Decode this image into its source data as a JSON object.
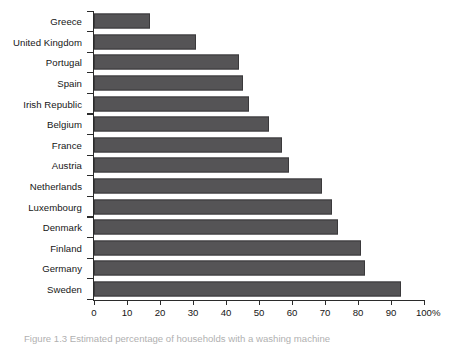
{
  "chart_data": {
    "type": "bar",
    "orientation": "horizontal",
    "title": "",
    "xlabel": "",
    "ylabel": "",
    "xlim": [
      0,
      100
    ],
    "grid": false,
    "legend": false,
    "bar_color": "#555456",
    "bar_edge_color": "#3a393b",
    "axis_color": "#2b2b2b",
    "categories": [
      "Greece",
      "United Kingdom",
      "Portugal",
      "Spain",
      "Irish Republic",
      "Belgium",
      "France",
      "Austria",
      "Netherlands",
      "Luxembourg",
      "Denmark",
      "Finland",
      "Germany",
      "Sweden"
    ],
    "values": [
      17,
      31,
      44,
      45,
      47,
      53,
      57,
      59,
      69,
      72,
      74,
      81,
      82,
      93
    ],
    "xticks": [
      0,
      10,
      20,
      30,
      40,
      50,
      60,
      70,
      80,
      90,
      100
    ],
    "xtick_labels": [
      "0",
      "10",
      "20",
      "30",
      "40",
      "50",
      "60",
      "70",
      "80",
      "90",
      "100%"
    ]
  },
  "caption": {
    "text": "Figure  1.3   Estimated  percentage  of  households  with  a  washing  machine"
  }
}
